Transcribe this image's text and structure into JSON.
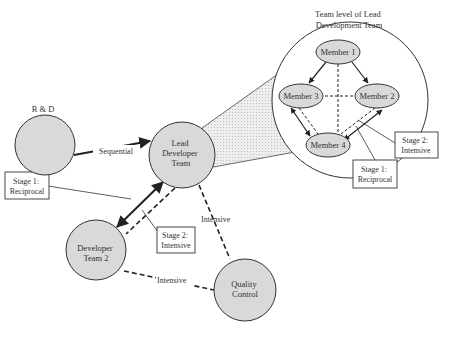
{
  "diagram": {
    "title": [
      "Team level of Lead",
      "Development Team"
    ],
    "colors": {
      "node_fill": "#d9d9d9",
      "stroke": "#333333",
      "zoom_wedge": "#e6e6e6",
      "background": "#ffffff"
    },
    "nodes": {
      "rd": {
        "label": [
          "R & D"
        ]
      },
      "lead": {
        "label": [
          "Lead",
          "Developer",
          "Team"
        ]
      },
      "dev2": {
        "label": [
          "Developer",
          "Team 2"
        ]
      },
      "qc": {
        "label": [
          "Quality",
          "Control"
        ]
      },
      "m1": {
        "label": [
          "Member 1"
        ]
      },
      "m2": {
        "label": [
          "Member 2"
        ]
      },
      "m3": {
        "label": [
          "Member 3"
        ]
      },
      "m4": {
        "label": [
          "Member 4"
        ]
      }
    },
    "edges": [
      {
        "from": "R & D",
        "to": "Lead Developer Team",
        "type": "solid-arrow",
        "label": "Sequential"
      },
      {
        "from": "Lead Developer Team",
        "to": "Developer Team 2",
        "type": "solid-double-arrow",
        "label": "Stage 1: Reciprocal"
      },
      {
        "from": "Lead Developer Team",
        "to": "Developer Team 2",
        "type": "dashed",
        "label": "Stage 2: Intensive"
      },
      {
        "from": "Lead Developer Team",
        "to": "Quality Control",
        "type": "dashed",
        "label": "Intensive"
      },
      {
        "from": "Developer Team 2",
        "to": "Quality Control",
        "type": "dashed",
        "label": "Intensive"
      },
      {
        "from": "Member 1",
        "to": "Member 3",
        "type": "solid-arrow"
      },
      {
        "from": "Member 1",
        "to": "Member 2",
        "type": "solid-arrow"
      },
      {
        "from": "Member 1",
        "to": "Member 4",
        "type": "dashed"
      },
      {
        "from": "Member 3",
        "to": "Member 2",
        "type": "dashed"
      },
      {
        "from": "Member 3",
        "to": "Member 4",
        "type": "solid-double-arrow + dashed"
      },
      {
        "from": "Member 2",
        "to": "Member 4",
        "type": "solid-double-arrow + dashed"
      }
    ],
    "edge_labels": {
      "sequential": "Sequential",
      "intensive_lead_qc": "Intensive",
      "intensive_dev2_qc": "Intensive"
    },
    "callouts": {
      "left_stage1": [
        "Stage 1:",
        "Reciprocal"
      ],
      "left_stage2": [
        "Stage 2:",
        "Intensive"
      ],
      "right_stage2": [
        "Stage 2:",
        "Intensive"
      ],
      "right_stage1": [
        "Stage 1:",
        "Reciprocal"
      ]
    }
  }
}
